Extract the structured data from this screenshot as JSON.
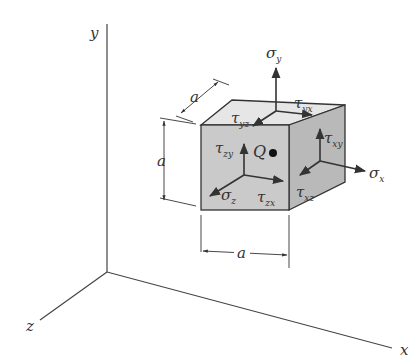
{
  "figure": {
    "type": "3D stress element diagram",
    "axes": {
      "x_label": "x",
      "y_label": "y",
      "z_label": "z"
    },
    "element": {
      "dimension_label": "a",
      "point_label": "Q",
      "point_symbol": "●"
    },
    "stresses": {
      "normal": [
        {
          "sym": "σ",
          "sub": "y"
        },
        {
          "sym": "σ",
          "sub": "x"
        },
        {
          "sym": "σ",
          "sub": "z"
        }
      ],
      "shear": [
        {
          "sym": "τ",
          "sub": "yx"
        },
        {
          "sym": "τ",
          "sub": "yz"
        },
        {
          "sym": "τ",
          "sub": "xy"
        },
        {
          "sym": "τ",
          "sub": "xz"
        },
        {
          "sym": "τ",
          "sub": "zy"
        },
        {
          "sym": "τ",
          "sub": "zx"
        }
      ]
    },
    "colors": {
      "front_face": "#c9c9c9",
      "top_face": "#e4e4e4",
      "right_face": "#b8b8b8",
      "edges": "#333333"
    }
  }
}
